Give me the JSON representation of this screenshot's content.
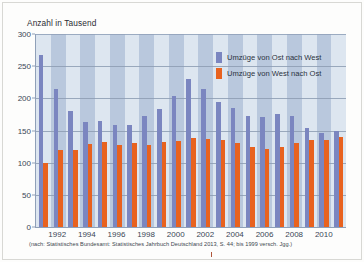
{
  "figure": {
    "axis_title": "Anzahl in Tausend",
    "source_note": "(nach: Statistisches Bundesamt: Statistisches Jahrbuch Deutschland 2013, S. 44; bis 1999 versch. Jgg.)"
  },
  "legend": {
    "items": [
      {
        "label": "Umzüge von Ost nach West",
        "color": "#7b86c0",
        "key": "east_west"
      },
      {
        "label": "Umzüge von West nach Ost",
        "color": "#e8621f",
        "key": "west_east"
      }
    ]
  },
  "colors": {
    "east_west": "#7b86c0",
    "west_east": "#e8621f",
    "band_light": "#dde6f0",
    "band_dark": "#b9c8dd",
    "gridline": "#8d9cb3",
    "axis": "#8fa0b8"
  },
  "chart_data": {
    "type": "bar",
    "title": "Anzahl in Tausend",
    "xlabel": "",
    "ylabel": "Anzahl in Tausend",
    "ylim": [
      0,
      300
    ],
    "yticks": [
      0,
      50,
      100,
      150,
      200,
      250,
      300
    ],
    "grid": true,
    "legend_position": "inside-top-right",
    "categories": [
      "1991",
      "1992",
      "1993",
      "1994",
      "1995",
      "1996",
      "1997",
      "1998",
      "1999",
      "2000",
      "2001",
      "2002",
      "2003",
      "2004",
      "2005",
      "2006",
      "2007",
      "2008",
      "2009",
      "2010",
      "2011"
    ],
    "xtick_labels": [
      "1992",
      "1994",
      "1996",
      "1998",
      "2000",
      "2002",
      "2004",
      "2006",
      "2008",
      "2010"
    ],
    "series": [
      {
        "name": "Umzüge von Ost nach West",
        "color": "#7b86c0",
        "values": [
          268,
          215,
          180,
          163,
          165,
          158,
          159,
          172,
          184,
          203,
          230,
          215,
          194,
          185,
          173,
          171,
          175,
          172,
          154,
          146,
          149
        ]
      },
      {
        "name": "Umzüge von West nach Ost",
        "color": "#e8621f",
        "values": [
          99,
          120,
          119,
          129,
          132,
          128,
          130,
          128,
          132,
          133,
          138,
          137,
          135,
          130,
          125,
          122,
          125,
          130,
          135,
          135,
          140
        ]
      }
    ],
    "annotations": [
      "(nach: Statistisches Bundesamt: Statistisches Jahrbuch Deutschland 2013, S. 44; bis 1999 versch. Jgg.)"
    ]
  }
}
